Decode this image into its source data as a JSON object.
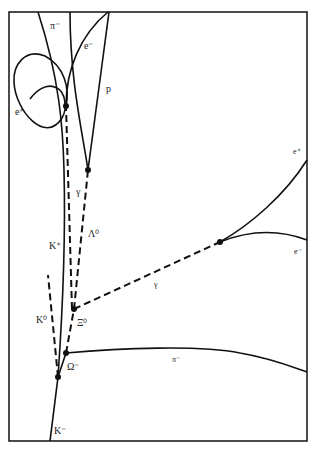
{
  "diagram": {
    "labels": {
      "pi_minus_top": "π⁻",
      "e_minus_top": "e⁻",
      "p": "p",
      "e_plus_spiral": "e⁺",
      "gamma_upper": "γ",
      "lambda0": "Λ⁰",
      "k_plus": "K⁺",
      "e_plus_right": "e⁺",
      "e_minus_right": "e⁻",
      "gamma_right": "γ",
      "k0": "K⁰",
      "xi0": "Ξ⁰",
      "omega_minus": "Ω⁻",
      "pi_minus_right": "π⁻",
      "k_minus": "K⁻"
    },
    "tracks": [
      {
        "particle": "K⁻",
        "type": "charged"
      },
      {
        "particle": "K⁺",
        "type": "charged"
      },
      {
        "particle": "K⁰",
        "type": "neutral"
      },
      {
        "particle": "Ω⁻",
        "type": "charged"
      },
      {
        "particle": "Ξ⁰",
        "type": "neutral"
      },
      {
        "particle": "π⁻",
        "type": "charged"
      },
      {
        "particle": "Λ⁰",
        "type": "neutral"
      },
      {
        "particle": "γ",
        "type": "neutral"
      },
      {
        "particle": "p",
        "type": "charged"
      },
      {
        "particle": "e⁺",
        "type": "charged"
      },
      {
        "particle": "e⁻",
        "type": "charged"
      }
    ]
  }
}
